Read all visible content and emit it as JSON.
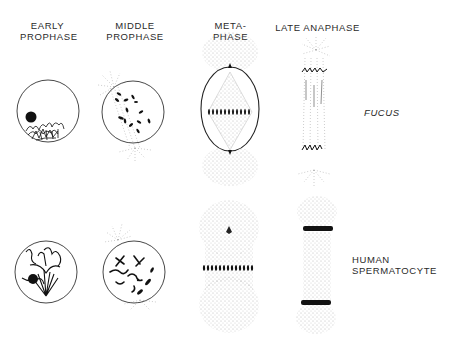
{
  "columns": [
    {
      "id": "early-prophase",
      "line1": "EARLY",
      "line2": "PROPHASE"
    },
    {
      "id": "middle-prophase",
      "line1": "MIDDLE",
      "line2": "PROPHASE"
    },
    {
      "id": "metaphase",
      "line1": "META-",
      "line2": "PHASE"
    },
    {
      "id": "late-anaphase",
      "line1": "LATE ANAPHASE",
      "line2": ""
    }
  ],
  "rows": [
    {
      "id": "fucus",
      "label": "FUCUS",
      "style": "italic"
    },
    {
      "id": "human-spermatocyte",
      "line1": "HUMAN",
      "line2": "SPERMATOCYTE"
    }
  ],
  "colors": {
    "ink": "#1a1a1a",
    "stipple": "#888888",
    "outline": "#333333"
  }
}
